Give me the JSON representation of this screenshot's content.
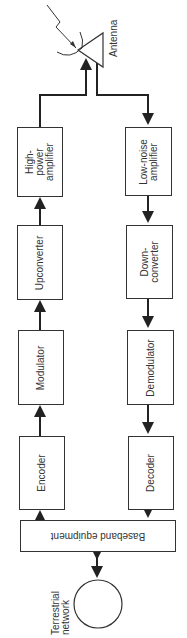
{
  "diagram": {
    "type": "block-diagram",
    "orientation": "rotated-90",
    "transmit_chain": [
      {
        "id": "encoder",
        "label": "Encoder"
      },
      {
        "id": "modulator",
        "label": "Modulator"
      },
      {
        "id": "upconverter",
        "label": "Upconverter"
      },
      {
        "id": "hpa",
        "label": "High-\npower\namplifier"
      }
    ],
    "receive_chain": [
      {
        "id": "lna",
        "label": "Low-noise\namplifier"
      },
      {
        "id": "downconverter",
        "label": "Down-\nconverter"
      },
      {
        "id": "demodulator",
        "label": "Demodulator"
      },
      {
        "id": "decoder",
        "label": "Decoder"
      }
    ],
    "baseband": {
      "label": "Baseband equipment"
    },
    "terrestrial": {
      "label": "Terrestrial\nnetwork"
    },
    "antenna": {
      "label": "Antenna"
    },
    "line_color": "#222222"
  }
}
